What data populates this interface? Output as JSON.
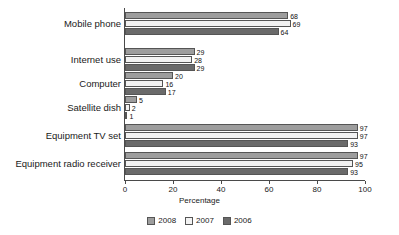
{
  "chart_data": {
    "type": "bar",
    "orientation": "horizontal",
    "title": "",
    "xlabel": "Percentage",
    "ylabel": "",
    "xlim": [
      0,
      100
    ],
    "xticks": [
      0,
      20,
      40,
      60,
      80,
      100
    ],
    "xtick_labels": [
      "0",
      "20",
      "40",
      "60",
      "80",
      "100"
    ],
    "grid": false,
    "legend_position": "bottom-center",
    "categories": [
      "Mobile phone",
      "Internet use",
      "Computer",
      "Satellite dish",
      "Equipment TV set",
      "Equipment radio receiver"
    ],
    "series": [
      {
        "name": "2008",
        "color": "#9d9d9d",
        "values": [
          68,
          29,
          20,
          5,
          97,
          97
        ]
      },
      {
        "name": "2007",
        "color": "#f2f2f2",
        "values": [
          69,
          28,
          16,
          2,
          97,
          95
        ]
      },
      {
        "name": "2006",
        "color": "#6a6a6a",
        "values": [
          64,
          29,
          17,
          1,
          93,
          93
        ]
      }
    ],
    "data_labels": {
      "Mobile phone": {
        "2008": "68",
        "2007": "69",
        "2006": "64"
      },
      "Internet use": {
        "2008": "29",
        "2007": "28",
        "2006": "29"
      },
      "Computer": {
        "2008": "20",
        "2007": "16",
        "2006": "17"
      },
      "Satellite dish": {
        "2008": "5",
        "2007": "2",
        "2006": "1"
      },
      "Equipment TV set": {
        "2008": "97",
        "2007": "97",
        "2006": "93"
      },
      "Equipment radio receiver": {
        "2008": "97",
        "2007": "95",
        "2006": "93"
      }
    }
  },
  "legend": {
    "items": [
      {
        "label": "2008"
      },
      {
        "label": "2007"
      },
      {
        "label": "2006"
      }
    ]
  },
  "axis": {
    "x_title": "Percentage"
  }
}
